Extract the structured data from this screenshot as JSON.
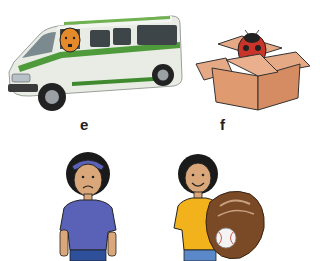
{
  "items": [
    {
      "label": "e",
      "picture": "van with man driving",
      "icon": "van-icon"
    },
    {
      "label": "f",
      "picture": "ladybug in open cardboard box",
      "icon": "ladybug-box-icon"
    },
    {
      "label": "",
      "picture": "sad boy with cap",
      "icon": "sad-boy-icon"
    },
    {
      "label": "",
      "picture": "smiling boy holding baseball glove with ball",
      "icon": "boy-baseball-glove-icon"
    }
  ],
  "colors": {
    "van_body": "#e8ece4",
    "van_stripe": "#4f9a3a",
    "box": "#e0a27a",
    "ladybug": "#c8342a",
    "shirt_blue": "#5a62b8",
    "shirt_yellow": "#f2b21c",
    "glove": "#7a4a26",
    "skin": "#d9a77a",
    "hair": "#1a1a1a"
  }
}
